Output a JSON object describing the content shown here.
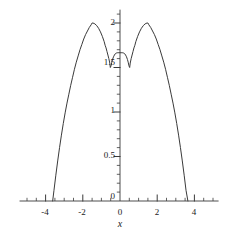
{
  "chart_data": {
    "type": "line",
    "title": "",
    "subtitle": "",
    "xlabel": "x",
    "ylabel": "",
    "xlim": [
      -5.4,
      5.3
    ],
    "xlim_visible_axis": [
      -5.4,
      5.3
    ],
    "ylim": [
      0,
      2.15
    ],
    "grid": false,
    "legend": null,
    "legend_position": "none",
    "line_color": "#3a3a3a",
    "axis_color": "#3a3a3a",
    "xticks_major": [
      -4,
      -2,
      0,
      2,
      4
    ],
    "xticklabels": [
      "-4",
      "-2",
      "0",
      "2",
      "4"
    ],
    "xticks_minor_step": 0.5,
    "yticks_major": [
      0,
      0.5,
      1,
      1.5,
      2
    ],
    "yticklabels": [
      "0",
      "0.5",
      "1",
      "1.5",
      "2"
    ],
    "yticks_minor_step": 0.1,
    "annotations": [],
    "features": {
      "left_zero_crossing": -3.62,
      "right_zero_crossing": 3.65,
      "left_peak_x": -1.5,
      "left_peak_y": 2.0,
      "right_peak_x": 1.5,
      "right_peak_y": 2.0,
      "center_local_max_x": 0.0,
      "center_local_max_y": 1.66,
      "left_local_min_x": -0.52,
      "left_local_min_y": 1.5,
      "right_local_min_x": 0.52,
      "right_local_min_y": 1.5
    },
    "series": [
      {
        "name": "curve",
        "x": [
          -3.62,
          -3.55,
          -3.45,
          -3.35,
          -3.25,
          -3.15,
          -3.05,
          -2.95,
          -2.85,
          -2.75,
          -2.65,
          -2.55,
          -2.45,
          -2.35,
          -2.25,
          -2.15,
          -2.05,
          -1.95,
          -1.85,
          -1.75,
          -1.65,
          -1.55,
          -1.5,
          -1.45,
          -1.35,
          -1.25,
          -1.15,
          -1.05,
          -0.95,
          -0.85,
          -0.8,
          -0.75,
          -0.7,
          -0.65,
          -0.6,
          -0.55,
          -0.52,
          -0.48,
          -0.44,
          -0.4,
          -0.35,
          -0.3,
          -0.25,
          -0.2,
          -0.15,
          -0.1,
          -0.05,
          0.0,
          0.05,
          0.1,
          0.15,
          0.2,
          0.25,
          0.3,
          0.35,
          0.4,
          0.44,
          0.48,
          0.52,
          0.55,
          0.6,
          0.65,
          0.7,
          0.75,
          0.8,
          0.85,
          0.95,
          1.05,
          1.15,
          1.25,
          1.35,
          1.45,
          1.5,
          1.55,
          1.65,
          1.75,
          1.85,
          1.95,
          2.05,
          2.15,
          2.25,
          2.35,
          2.45,
          2.55,
          2.65,
          2.75,
          2.85,
          2.95,
          3.05,
          3.15,
          3.25,
          3.35,
          3.45,
          3.55,
          3.65
        ],
        "y": [
          0.0,
          0.12,
          0.29,
          0.45,
          0.6,
          0.74,
          0.87,
          0.99,
          1.1,
          1.2,
          1.3,
          1.39,
          1.48,
          1.56,
          1.63,
          1.7,
          1.76,
          1.82,
          1.87,
          1.91,
          1.95,
          1.98,
          2.0,
          2.0,
          1.99,
          1.97,
          1.94,
          1.9,
          1.85,
          1.79,
          1.75,
          1.72,
          1.68,
          1.64,
          1.6,
          1.55,
          1.5,
          1.52,
          1.56,
          1.59,
          1.62,
          1.64,
          1.655,
          1.662,
          1.665,
          1.666,
          1.666,
          1.666,
          1.666,
          1.666,
          1.665,
          1.662,
          1.655,
          1.64,
          1.62,
          1.59,
          1.56,
          1.52,
          1.5,
          1.55,
          1.6,
          1.64,
          1.68,
          1.72,
          1.75,
          1.79,
          1.85,
          1.9,
          1.94,
          1.97,
          1.99,
          2.0,
          2.0,
          1.98,
          1.95,
          1.91,
          1.87,
          1.82,
          1.76,
          1.7,
          1.63,
          1.56,
          1.48,
          1.39,
          1.3,
          1.2,
          1.1,
          0.99,
          0.87,
          0.74,
          0.6,
          0.45,
          0.29,
          0.12,
          0.0
        ]
      }
    ]
  },
  "axes": {
    "x_axis_title": "x",
    "y_tick_labels": [
      {
        "text": "2",
        "value": 2
      },
      {
        "text": "1.5",
        "value": 1.5
      },
      {
        "text": "1",
        "value": 1
      },
      {
        "text": "0.5",
        "value": 0.5
      },
      {
        "text": "0",
        "value": 0
      }
    ],
    "x_tick_labels": [
      {
        "text": "-4",
        "value": -4
      },
      {
        "text": "-2",
        "value": -2
      },
      {
        "text": "0",
        "value": 0
      },
      {
        "text": "2",
        "value": 2
      },
      {
        "text": "4",
        "value": 4
      }
    ]
  }
}
